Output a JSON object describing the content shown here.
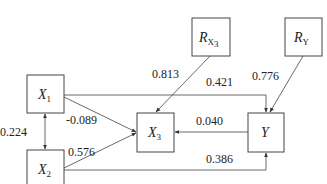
{
  "nodes": {
    "x1": {
      "name": "X",
      "sub": "1"
    },
    "x2": {
      "name": "X",
      "sub": "2"
    },
    "x3": {
      "name": "X",
      "sub": "3"
    },
    "y": {
      "name": "Y"
    },
    "rx3": {
      "name": "R",
      "sub": "X",
      "subsub": "3"
    },
    "ry": {
      "name": "R",
      "sub": "Y"
    }
  },
  "edges": {
    "x1_x2": "0.224",
    "x1_x3": "-0.089",
    "x2_x3": "0.576",
    "rx3_x3": "0.813",
    "x1_y": "0.421",
    "ry_y": "0.776",
    "y_x3": "0.040",
    "x2_y": "0.386"
  },
  "colors": {
    "line": "#444444",
    "text": "#222222"
  }
}
